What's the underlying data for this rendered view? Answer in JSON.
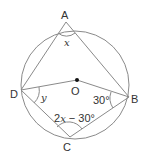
{
  "diagram": {
    "type": "cyclic-quadrilateral",
    "points": {
      "A": {
        "label": "A"
      },
      "B": {
        "label": "B"
      },
      "C": {
        "label": "C"
      },
      "D": {
        "label": "D"
      },
      "O": {
        "label": "O"
      }
    },
    "angles": {
      "at_A": "x",
      "at_D": "y",
      "at_B": "30°",
      "at_C_prefix": "2",
      "at_C_var": "x",
      "at_C_suffix": " − 30°"
    },
    "colors": {
      "line": "#8a8a8a",
      "text": "#333333"
    }
  }
}
